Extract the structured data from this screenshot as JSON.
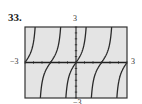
{
  "problem": {
    "number": "33."
  },
  "window": {
    "xmin_label": "−3",
    "xmax_label": "3",
    "ymax_label": "3",
    "ymin_label": "−3"
  },
  "colors": {
    "plot_background": "#e4e4e4",
    "frame": "#333333",
    "axis": "#222222",
    "curve": "#2a2a2a"
  },
  "chart_data": {
    "type": "line",
    "title": "33.",
    "function": "y = tan(2πx/3)",
    "xlabel": "",
    "ylabel": "",
    "xlim": [
      -3,
      3
    ],
    "ylim": [
      -3,
      3
    ],
    "tick_labels": {
      "x": [
        "−3",
        "3"
      ],
      "y": [
        "−3",
        "3"
      ]
    },
    "grid": false,
    "axes_tick_marks": true,
    "period": 1.5,
    "vertical_asymptotes": [
      -2.25,
      -0.75,
      0.75,
      2.25
    ],
    "zeros": [
      -3,
      -1.5,
      0,
      1.5,
      3
    ],
    "series": [
      {
        "name": "branch-1",
        "x": [
          -3.0,
          -2.8,
          -2.6,
          -2.45,
          -2.35
        ],
        "y": [
          0.0,
          0.44,
          1.0,
          1.73,
          2.5
        ]
      },
      {
        "name": "branch-2",
        "x": [
          -2.15,
          -2.05,
          -1.9,
          -1.7,
          -1.5,
          -1.3,
          -1.1,
          -0.95,
          -0.85
        ],
        "y": [
          -2.5,
          -1.73,
          -1.0,
          -0.44,
          0.0,
          0.44,
          1.0,
          1.73,
          2.5
        ]
      },
      {
        "name": "branch-3",
        "x": [
          -0.65,
          -0.55,
          -0.4,
          -0.2,
          0.0,
          0.2,
          0.4,
          0.55,
          0.65
        ],
        "y": [
          -2.5,
          -1.73,
          -1.0,
          -0.44,
          0.0,
          0.44,
          1.0,
          1.73,
          2.5
        ]
      },
      {
        "name": "branch-4",
        "x": [
          0.85,
          0.95,
          1.1,
          1.3,
          1.5,
          1.7,
          1.9,
          2.05,
          2.15
        ],
        "y": [
          -2.5,
          -1.73,
          -1.0,
          -0.44,
          0.0,
          0.44,
          1.0,
          1.73,
          2.5
        ]
      },
      {
        "name": "branch-5",
        "x": [
          2.35,
          2.45,
          2.6,
          2.8,
          3.0
        ],
        "y": [
          -2.5,
          -1.73,
          -1.0,
          -0.44,
          0.0
        ]
      }
    ]
  }
}
